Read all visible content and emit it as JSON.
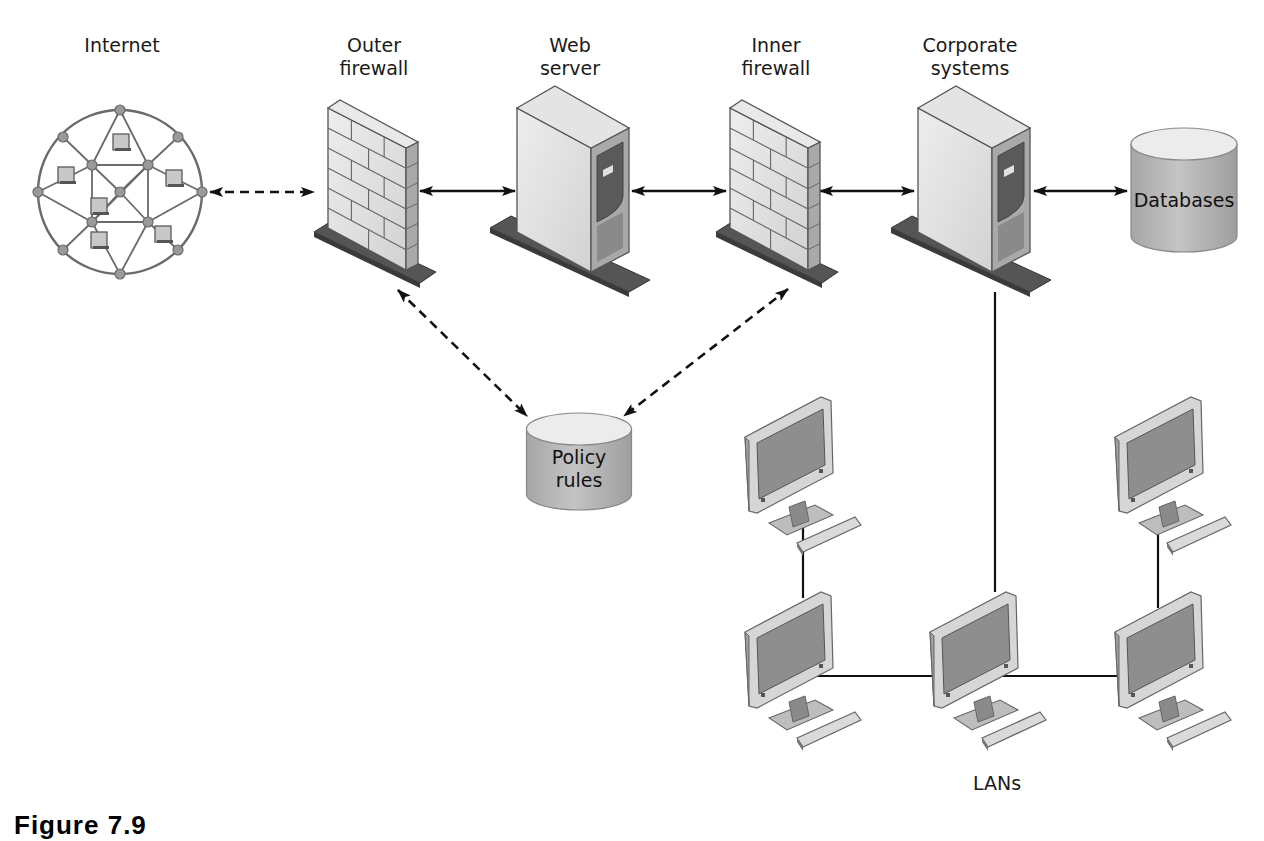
{
  "diagram": {
    "caption": "Figure 7.9",
    "colors": {
      "line": "#111111",
      "device_light": "#dcdcdc",
      "device_face": "#e6e6e6",
      "device_side": "#a9a9a9",
      "device_dark": "#5a5a5a",
      "base_plate": "#555555",
      "cylinder_body": "#b9b9b9",
      "cylinder_top": "#ececec",
      "screen": "#8e8e8e"
    },
    "nodes": {
      "internet": {
        "label": "Internet",
        "type": "network-globe",
        "cx": 120,
        "cy": 192,
        "r": 82,
        "label_x": 122,
        "label_y": 34
      },
      "outer_firewall": {
        "label": "Outer\nfirewall",
        "type": "firewall",
        "x": 328,
        "label_x": 374,
        "label_y": 34
      },
      "web_server": {
        "label": "Web\nserver",
        "type": "server",
        "x": 517,
        "label_x": 570,
        "label_y": 34
      },
      "inner_firewall": {
        "label": "Inner\nfirewall",
        "type": "firewall",
        "x": 730,
        "label_x": 776,
        "label_y": 34
      },
      "corporate_systems": {
        "label": "Corporate\nsystems",
        "type": "server",
        "x": 918,
        "label_x": 970,
        "label_y": 34
      },
      "databases": {
        "label": "Databases",
        "type": "database",
        "cx": 1184,
        "top": 128,
        "w": 106,
        "h": 124
      },
      "policy_rules": {
        "label": "Policy\nrules",
        "type": "database",
        "cx": 579,
        "top": 413,
        "w": 105,
        "h": 97
      },
      "lans": {
        "label": "LANs",
        "type": "lan-group",
        "label_x": 997,
        "label_y": 772,
        "computers": [
          {
            "id": "pc-1",
            "x": 745,
            "y": 395
          },
          {
            "id": "pc-2",
            "x": 1115,
            "y": 395
          },
          {
            "id": "pc-3",
            "x": 745,
            "y": 590
          },
          {
            "id": "pc-4",
            "x": 930,
            "y": 590
          },
          {
            "id": "pc-5",
            "x": 1115,
            "y": 590
          }
        ]
      }
    },
    "edges": [
      {
        "from": "internet",
        "to": "outer_firewall",
        "style": "dashed",
        "bidirectional": true,
        "x1": 210,
        "y1": 192,
        "x2": 314,
        "y2": 192
      },
      {
        "from": "outer_firewall",
        "to": "web_server",
        "style": "solid",
        "bidirectional": true,
        "x1": 420,
        "y1": 191,
        "x2": 515,
        "y2": 191
      },
      {
        "from": "web_server",
        "to": "inner_firewall",
        "style": "solid",
        "bidirectional": true,
        "x1": 632,
        "y1": 191,
        "x2": 726,
        "y2": 191
      },
      {
        "from": "inner_firewall",
        "to": "corporate_systems",
        "style": "solid",
        "bidirectional": true,
        "x1": 820,
        "y1": 191,
        "x2": 914,
        "y2": 191
      },
      {
        "from": "corporate_systems",
        "to": "databases",
        "style": "solid",
        "bidirectional": true,
        "x1": 1034,
        "y1": 191,
        "x2": 1127,
        "y2": 191
      },
      {
        "from": "outer_firewall",
        "to": "policy_rules",
        "style": "dashed",
        "bidirectional": true,
        "x1": 398,
        "y1": 290,
        "x2": 527,
        "y2": 416
      },
      {
        "from": "inner_firewall",
        "to": "policy_rules",
        "style": "dashed",
        "bidirectional": true,
        "x1": 788,
        "y1": 289,
        "x2": 624,
        "y2": 416
      },
      {
        "from": "corporate_systems",
        "to": "lans",
        "style": "plain",
        "bidirectional": false,
        "points": [
          [
            995,
            292
          ],
          [
            995,
            592
          ]
        ]
      },
      {
        "from": "pc-1",
        "to": "pc-3",
        "style": "plain",
        "bidirectional": false,
        "points": [
          [
            803,
            526
          ],
          [
            803,
            598
          ]
        ]
      },
      {
        "from": "pc-2",
        "to": "pc-5",
        "style": "plain",
        "bidirectional": false,
        "points": [
          [
            1158,
            526
          ],
          [
            1158,
            608
          ]
        ]
      },
      {
        "from": "pc-3",
        "to": "pc-5",
        "style": "plain",
        "bidirectional": false,
        "points": [
          [
            812,
            676
          ],
          [
            1120,
            676
          ]
        ]
      }
    ]
  }
}
